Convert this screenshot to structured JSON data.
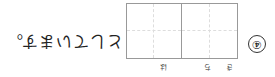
{
  "question": {
    "number": "④",
    "furigana": [
      "き",
      "ち",
      "は"
    ],
    "answer_boxes": 2,
    "trailing_text": "としています。"
  }
}
